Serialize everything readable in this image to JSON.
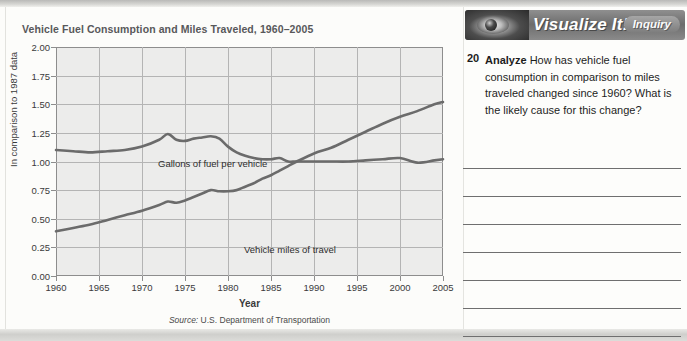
{
  "figure": {
    "title": "Vehicle Fuel Consumption and Miles Traveled, 1960–2005",
    "axis_x_title": "Year",
    "axis_y_title": "In comparison to 1987 data",
    "source_prefix": "Source:",
    "source_text": " U.S. Department of Transportation"
  },
  "chart_data": {
    "type": "line",
    "title": "Vehicle Fuel Consumption and Miles Traveled, 1960–2005",
    "xlabel": "Year",
    "ylabel": "In comparison to 1987 data",
    "xlim": [
      1960,
      2005
    ],
    "ylim": [
      0.0,
      2.0
    ],
    "xticks": [
      1960,
      1965,
      1970,
      1975,
      1980,
      1985,
      1990,
      1995,
      2000,
      2005
    ],
    "yticks": [
      0.0,
      0.25,
      0.5,
      0.75,
      1.0,
      1.25,
      1.5,
      1.75,
      2.0
    ],
    "ytick_labels": [
      "0.00",
      "0.25",
      "0.50",
      "0.75",
      "1.00",
      "1.25",
      "1.50",
      "1.75",
      "2.00"
    ],
    "grid": true,
    "legend": "inline-labels",
    "line_color": "#6b6b6b",
    "plot_background": "#ececeb",
    "source": "Source: U.S. Department of Transportation",
    "x": [
      1960,
      1962,
      1964,
      1966,
      1968,
      1970,
      1972,
      1973,
      1974,
      1975,
      1976,
      1977,
      1978,
      1979,
      1980,
      1981,
      1982,
      1983,
      1984,
      1985,
      1986,
      1987,
      1988,
      1990,
      1992,
      1994,
      1996,
      1998,
      2000,
      2002,
      2004,
      2005
    ],
    "series": [
      {
        "name": "Gallons of fuel per vehicle",
        "values": [
          1.1,
          1.09,
          1.08,
          1.09,
          1.1,
          1.13,
          1.19,
          1.24,
          1.19,
          1.18,
          1.2,
          1.21,
          1.22,
          1.2,
          1.13,
          1.08,
          1.05,
          1.03,
          1.02,
          1.02,
          1.03,
          1.0,
          1.0,
          1.0,
          1.0,
          1.0,
          1.01,
          1.02,
          1.03,
          0.99,
          1.01,
          1.02
        ]
      },
      {
        "name": "Vehicle miles of travel",
        "values": [
          0.39,
          0.42,
          0.45,
          0.49,
          0.53,
          0.57,
          0.62,
          0.65,
          0.64,
          0.66,
          0.69,
          0.72,
          0.75,
          0.74,
          0.74,
          0.75,
          0.78,
          0.81,
          0.85,
          0.88,
          0.92,
          0.96,
          1.0,
          1.07,
          1.12,
          1.19,
          1.26,
          1.33,
          1.39,
          1.44,
          1.5,
          1.52
        ]
      }
    ]
  },
  "panel": {
    "banner_title": "Visualize It!",
    "badge_label": "Inquiry",
    "eye_icon": "eye-icon",
    "question_number": "20",
    "question_verb": "Analyze",
    "question_text": "How has vehicle fuel consumption in comparison to miles traveled changed since 1960? What is the likely cause for this change?",
    "answer_line_count": 7
  }
}
